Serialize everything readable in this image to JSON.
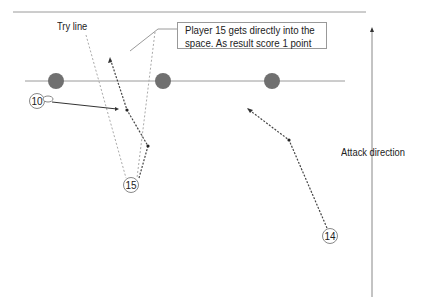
{
  "diagram": {
    "labels": {
      "try_line": "Try line",
      "callout_line1": "Player 15 gets directly into the",
      "callout_line2": "space. As result score 1 point",
      "attack_direction": "Attack direction"
    },
    "players": [
      {
        "number": "10",
        "x": 37,
        "y": 101
      },
      {
        "number": "15",
        "x": 131,
        "y": 185
      },
      {
        "number": "14",
        "x": 330,
        "y": 236
      }
    ],
    "defenders": [
      {
        "x": 56,
        "y": 81
      },
      {
        "x": 163,
        "y": 81
      },
      {
        "x": 272,
        "y": 81
      }
    ],
    "colors": {
      "defender": "#707070",
      "line": "#9a9a9a",
      "dotted": "#555555",
      "text": "#222222"
    }
  }
}
